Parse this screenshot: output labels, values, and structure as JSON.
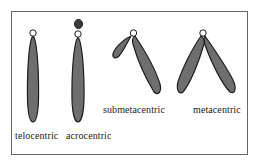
{
  "figure": {
    "frame_color": "#666666",
    "chromosome_fill": "#6e6e6e",
    "chromosome_stroke": "#1e1e1e",
    "centromere_fill": "#ffffff",
    "types": [
      {
        "id": "telocentric",
        "label": "telocentric"
      },
      {
        "id": "acrocentric",
        "label": "acrocentric"
      },
      {
        "id": "submetacentric",
        "label": "submetacentric"
      },
      {
        "id": "metacentric",
        "label": "metacentric"
      }
    ]
  }
}
